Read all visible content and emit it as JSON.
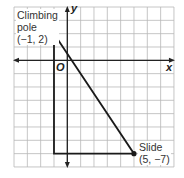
{
  "diagram": {
    "type": "coordinate-grid",
    "grid": {
      "x_min": -4,
      "x_max": 8,
      "y_min": -8,
      "y_max": 4,
      "step": 1,
      "grid_color": "#b8b8b8"
    },
    "axes": {
      "x_label": "x",
      "y_label": "y",
      "origin_label": "O"
    },
    "points": [
      {
        "name": "Climbing pole",
        "label_line1": "Climbing",
        "label_line2": "pole",
        "coords_text": "(−1, 2)",
        "x": -1,
        "y": 2
      },
      {
        "name": "Slide",
        "label_line1": "Slide",
        "coords_text": "(5, −7)",
        "x": 5,
        "y": -7
      }
    ],
    "triangle_vertices": [
      [
        -1,
        2
      ],
      [
        -1,
        -7
      ],
      [
        5,
        -7
      ]
    ],
    "line_color": "#1a1a1a"
  }
}
